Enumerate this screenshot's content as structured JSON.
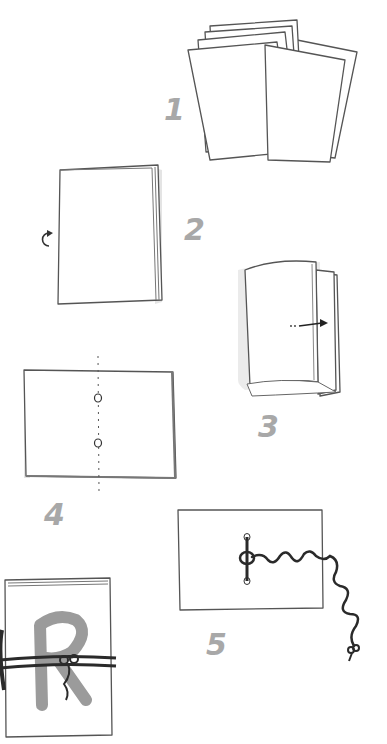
{
  "diagram": {
    "title": "",
    "steps": [
      {
        "number": "1",
        "description": "stack of loose paper sheets"
      },
      {
        "number": "2",
        "description": "squared paper stack with rotate arrow"
      },
      {
        "number": "3",
        "description": "stack folded in half, arrow showing fold"
      },
      {
        "number": "4",
        "description": "opened sheet with fold line and two punched holes"
      },
      {
        "number": "5",
        "description": "thread stitched through holes and tied"
      },
      {
        "number": "",
        "description": "finished booklet with letter R on cover, tied with string"
      }
    ],
    "cover_letter": "R",
    "colors": {
      "number_gray": "#a8a8a8",
      "line": "#555555",
      "thread": "#2a2a2a",
      "letter": "#8a8a8a"
    }
  }
}
